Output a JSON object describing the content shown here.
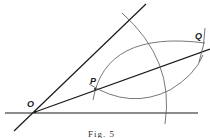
{
  "diagram": {
    "points": {
      "O": {
        "label": "O",
        "x": 35,
        "y": 112
      },
      "P": {
        "label": "P",
        "x": 95,
        "y": 89
      },
      "Q": {
        "label": "Q",
        "x": 202,
        "y": 46
      }
    },
    "caption": "Fig. 5",
    "colors": {
      "stroke": "#1a1a1a",
      "arc": "#555555",
      "background": "#ffffff"
    }
  }
}
